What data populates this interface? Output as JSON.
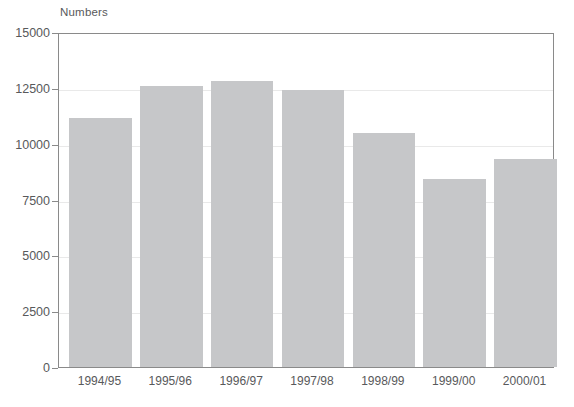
{
  "chart_data": {
    "type": "bar",
    "title": "",
    "subtitle": "",
    "xlabel": "",
    "ylabel": "Numbers",
    "categories": [
      "1994/95",
      "1995/96",
      "1996/97",
      "1997/98",
      "1998/99",
      "1999/00",
      "2000/01"
    ],
    "values": [
      11150,
      12600,
      12800,
      12400,
      10500,
      8400,
      9300
    ],
    "series": [
      {
        "name": "Numbers",
        "values": [
          11150,
          12600,
          12800,
          12400,
          10500,
          8400,
          9300
        ]
      }
    ],
    "ylim": [
      0,
      15000
    ],
    "ytick_values": [
      0,
      2500,
      5000,
      7500,
      10000,
      12500,
      15000
    ],
    "ytick_labels": [
      "0",
      "2500",
      "5000",
      "7500",
      "10000",
      "12500",
      "15000"
    ],
    "grid": true,
    "grid_axis": "y",
    "legend": false,
    "legend_position": "none",
    "bar_color": "#c6c7c9",
    "grid_color": "#e9e9e9",
    "axis_color": "#8a8a8a",
    "text_color": "#58595b",
    "background_color": "#ffffff"
  }
}
